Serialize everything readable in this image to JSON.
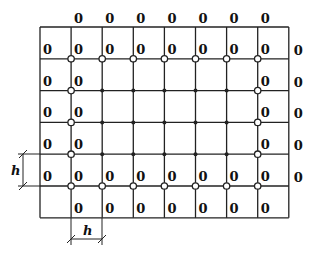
{
  "diagram": {
    "grid": {
      "columns": 8,
      "rows": 6,
      "interior_node_columns": 7,
      "interior_node_rows": 5
    },
    "boundary_value": "0",
    "node_types": {
      "boundary_adjacent": "hollow-circle",
      "interior": "filled-dot"
    },
    "dimension_labels": {
      "vertical": "h",
      "horizontal": "h"
    },
    "colors": {
      "line": "#222222",
      "text": "#111111",
      "background": "#ffffff"
    }
  }
}
